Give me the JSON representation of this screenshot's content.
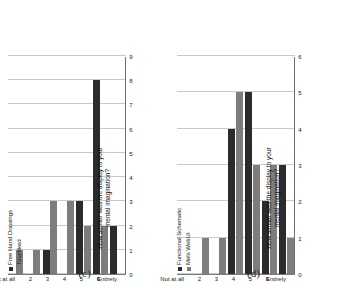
{
  "figure": {
    "panels": [
      {
        "panel_label": "(c)",
        "axis_title_line1": "How similar was the display to your",
        "axis_title_line2": "mental imagination?",
        "legend": [
          {
            "label": "Free Hand Drawings",
            "color": "#2b2b2b"
          },
          {
            "label": "Touchked",
            "color": "#7d7d7d"
          }
        ],
        "categories": [
          "Not at all",
          "2",
          "3",
          "4",
          "5",
          "6",
          "Entirely"
        ],
        "xticks": [
          "9",
          "8",
          "7",
          "6",
          "5",
          "4",
          "3",
          "2",
          "1",
          "0"
        ]
      },
      {
        "panel_label": "(d)",
        "axis_title_line1": "How similar was the display to your",
        "axis_title_line2": "mental imagination?",
        "legend": [
          {
            "label": "Functional Schematic",
            "color": "#2b2b2b"
          },
          {
            "label": "Mels WebUI",
            "color": "#7d7d7d"
          }
        ],
        "categories": [
          "Not at all",
          "2",
          "3",
          "4",
          "5",
          "6",
          "Entirely"
        ],
        "xticks": [
          "6",
          "5",
          "4",
          "3",
          "2",
          "1",
          "0"
        ]
      }
    ]
  },
  "chart_data": [
    {
      "type": "bar",
      "orientation": "horizontal",
      "title": "(c)",
      "xlabel": "",
      "ylabel": "How similar was the display to your mental imagination?",
      "categories": [
        "Not at all",
        "2",
        "3",
        "4",
        "5",
        "6",
        "Entirely"
      ],
      "series": [
        {
          "name": "Free Hand Drawings",
          "color": "#2b2b2b",
          "values": [
            0,
            0,
            1,
            0,
            3,
            8,
            2
          ]
        },
        {
          "name": "Touchked",
          "color": "#7d7d7d",
          "values": [
            1,
            1,
            3,
            3,
            2,
            2,
            0
          ]
        }
      ],
      "xlim": [
        0,
        9
      ],
      "xticks": [
        0,
        1,
        2,
        3,
        4,
        5,
        6,
        7,
        8,
        9
      ],
      "grid": true,
      "legend_position": "top-left"
    },
    {
      "type": "bar",
      "orientation": "horizontal",
      "title": "(d)",
      "xlabel": "",
      "ylabel": "How similar was the display to your mental imagination?",
      "categories": [
        "Not at all",
        "2",
        "3",
        "4",
        "5",
        "6",
        "Entirely"
      ],
      "series": [
        {
          "name": "Functional Schematic",
          "color": "#2b2b2b",
          "values": [
            0,
            0,
            0,
            4,
            5,
            2,
            3
          ]
        },
        {
          "name": "Mels WebUI",
          "color": "#7d7d7d",
          "values": [
            0,
            1,
            1,
            5,
            3,
            3,
            1
          ]
        }
      ],
      "xlim": [
        0,
        6
      ],
      "xticks": [
        0,
        1,
        2,
        3,
        4,
        5,
        6
      ],
      "grid": true,
      "legend_position": "top-left"
    }
  ]
}
